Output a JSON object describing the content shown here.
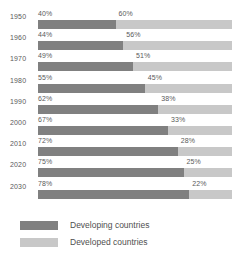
{
  "chart_data": {
    "type": "bar",
    "orientation": "horizontal",
    "stacked": true,
    "normalized": "percent",
    "title": "",
    "subtitle": "",
    "xlabel": "",
    "ylabel": "",
    "xlim": [
      0,
      100
    ],
    "grid": false,
    "legend_position": "bottom-left",
    "categories": [
      "1950",
      "1960",
      "1970",
      "1980",
      "1990",
      "2000",
      "2010",
      "2020",
      "2030"
    ],
    "series": [
      {
        "name": "Developing countries",
        "color": "#808080",
        "values": [
          40,
          44,
          49,
          55,
          62,
          67,
          72,
          75,
          78
        ],
        "labels": [
          "40%",
          "44%",
          "49%",
          "55%",
          "62%",
          "67%",
          "72%",
          "75%",
          "78%"
        ]
      },
      {
        "name": "Developed countries",
        "color": "#c8c8c8",
        "values": [
          60,
          56,
          51,
          45,
          38,
          33,
          28,
          25,
          22
        ],
        "labels": [
          "60%",
          "56%",
          "51%",
          "45%",
          "38%",
          "33%",
          "28%",
          "25%",
          "22%"
        ]
      }
    ],
    "rows": [
      {
        "year": "1950",
        "developing": 40,
        "developed": 60,
        "developing_label": "40%",
        "developed_label": "60%"
      },
      {
        "year": "1960",
        "developing": 44,
        "developed": 56,
        "developing_label": "44%",
        "developed_label": "56%"
      },
      {
        "year": "1970",
        "developing": 49,
        "developed": 51,
        "developing_label": "49%",
        "developed_label": "51%"
      },
      {
        "year": "1980",
        "developing": 55,
        "developed": 45,
        "developing_label": "55%",
        "developed_label": "45%"
      },
      {
        "year": "1990",
        "developing": 62,
        "developed": 38,
        "developing_label": "62%",
        "developed_label": "38%"
      },
      {
        "year": "2000",
        "developing": 67,
        "developed": 33,
        "developing_label": "67%",
        "developed_label": "33%"
      },
      {
        "year": "2010",
        "developing": 72,
        "developed": 28,
        "developing_label": "72%",
        "developed_label": "28%"
      },
      {
        "year": "2020",
        "developing": 75,
        "developed": 25,
        "developing_label": "75%",
        "developed_label": "25%"
      },
      {
        "year": "2030",
        "developing": 78,
        "developed": 22,
        "developing_label": "78%",
        "developed_label": "22%"
      }
    ]
  },
  "legend": {
    "items": [
      {
        "label": "Developing countries",
        "color": "#808080",
        "swatch": "dark"
      },
      {
        "label": "Developed countries",
        "color": "#c8c8c8",
        "swatch": "light"
      }
    ]
  },
  "colors": {
    "developing": "#808080",
    "developed": "#c8c8c8",
    "text": "#5a5a5a",
    "background": "#ffffff"
  }
}
